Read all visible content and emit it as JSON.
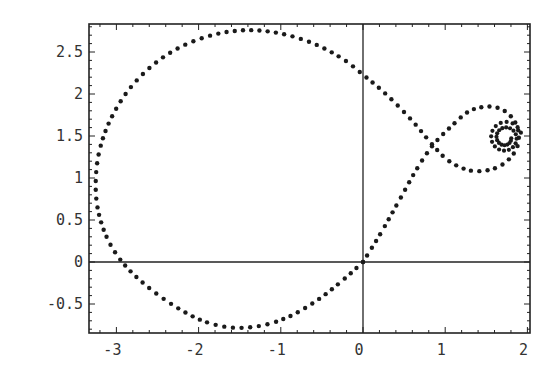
{
  "chart_data": {
    "type": "scatter",
    "title": "",
    "xlabel": "",
    "ylabel": "",
    "xlim": [
      -3.3,
      2.03
    ],
    "ylim": [
      -0.85,
      2.8
    ],
    "grid": false,
    "legend": null,
    "axes_through_origin": true,
    "x_ticks": [
      -3,
      -2,
      -1,
      0,
      1,
      2
    ],
    "x_tick_labels": [
      "-3",
      "-2",
      "-1",
      "0",
      "1",
      "2"
    ],
    "y_ticks": [
      -0.5,
      0,
      0.5,
      1,
      1.5,
      2,
      2.5
    ],
    "y_tick_labels": [
      "-0.5",
      "0",
      "0.5",
      "1",
      "1.5",
      "2",
      "2.5"
    ],
    "marker": "dot",
    "color": "#1a1a1a",
    "series": [
      {
        "name": "curve",
        "description": "Dotted parametric curve starting at origin: large loop to the left, crossing near (0.85,1.39), small loop on the right that winds into a spiral converging near (1.73,1.48)",
        "path_points": [
          [
            0.0,
            0.0
          ],
          [
            -0.25,
            -0.22
          ],
          [
            -0.55,
            -0.45
          ],
          [
            -0.9,
            -0.65
          ],
          [
            -1.25,
            -0.76
          ],
          [
            -1.6,
            -0.78
          ],
          [
            -1.95,
            -0.7
          ],
          [
            -2.3,
            -0.52
          ],
          [
            -2.65,
            -0.27
          ],
          [
            -2.93,
            0.0
          ],
          [
            -3.12,
            0.3
          ],
          [
            -3.23,
            0.65
          ],
          [
            -3.25,
            1.0
          ],
          [
            -3.2,
            1.35
          ],
          [
            -3.07,
            1.7
          ],
          [
            -2.85,
            2.05
          ],
          [
            -2.55,
            2.35
          ],
          [
            -2.2,
            2.57
          ],
          [
            -1.8,
            2.71
          ],
          [
            -1.4,
            2.76
          ],
          [
            -1.0,
            2.72
          ],
          [
            -0.6,
            2.6
          ],
          [
            -0.25,
            2.42
          ],
          [
            0.0,
            2.23
          ],
          [
            0.3,
            1.98
          ],
          [
            0.6,
            1.68
          ],
          [
            0.85,
            1.39
          ],
          [
            1.05,
            1.2
          ],
          [
            1.3,
            1.09
          ],
          [
            1.55,
            1.1
          ],
          [
            1.75,
            1.2
          ],
          [
            1.88,
            1.38
          ],
          [
            1.88,
            1.6
          ],
          [
            1.75,
            1.78
          ],
          [
            1.55,
            1.85
          ],
          [
            1.3,
            1.8
          ],
          [
            1.08,
            1.62
          ],
          [
            0.85,
            1.39
          ],
          [
            0.65,
            1.1
          ],
          [
            0.45,
            0.75
          ],
          [
            0.22,
            0.35
          ],
          [
            0.0,
            0.0
          ]
        ],
        "spiral": {
          "center": [
            1.73,
            1.48
          ],
          "outer_radius": 0.2,
          "inner_radius": 0.07,
          "turns": 2
        }
      }
    ]
  }
}
